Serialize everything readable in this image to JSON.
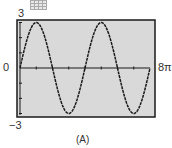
{
  "chart_data": {
    "type": "line",
    "title": "",
    "function": "y = 3 sin(x/2)",
    "x": [
      0,
      1.5708,
      3.1416,
      4.7124,
      6.2832,
      7.854,
      9.4248,
      10.9956,
      12.5664,
      14.1372,
      15.708,
      17.2788,
      18.8496,
      20.4204,
      21.9911,
      23.5619,
      25.1327
    ],
    "series": [
      {
        "name": "y = 3 sin(x/2)",
        "values": [
          0,
          2.12,
          3,
          2.12,
          0,
          -2.12,
          -3,
          -2.12,
          0,
          2.12,
          3,
          2.12,
          0,
          -2.12,
          -3,
          -2.12,
          0
        ]
      }
    ],
    "xlim": [
      0,
      25.1327
    ],
    "ylim": [
      -3,
      3
    ],
    "xlabel": "",
    "ylabel": "",
    "tick_labels": {
      "x_min": "0",
      "x_max": "8π",
      "y_max": "3",
      "y_min": "−3"
    },
    "x_tick_step": "π",
    "y_tick_step": 1,
    "grid": false,
    "caption": "(A)",
    "colors": {
      "background": "#d9d9d9",
      "curve": "#1a1a1a",
      "frame": "#1a1a1a"
    }
  },
  "labels": {
    "y_max": "3",
    "y_min": "−3",
    "x_min": "0",
    "x_max": "8π",
    "caption": "(A)"
  },
  "icons": {
    "window_icon": "grid-icon"
  }
}
